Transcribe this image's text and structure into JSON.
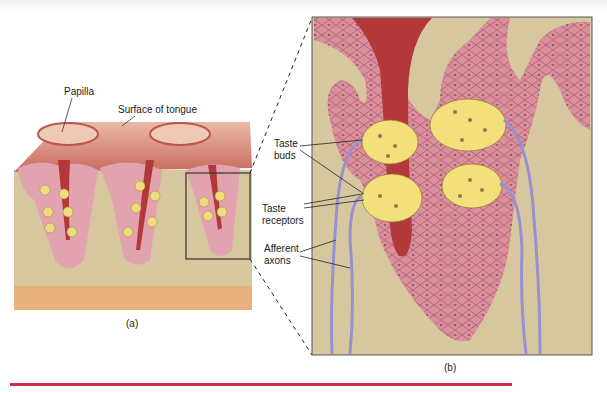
{
  "figure": {
    "panel_a": {
      "caption": "(a)",
      "labels": {
        "papilla": "Papilla",
        "surface": "Surface of tongue"
      }
    },
    "panel_b": {
      "caption": "(b)",
      "labels": {
        "taste_buds_1": "Taste",
        "taste_buds_2": "buds",
        "taste_receptors_1": "Taste",
        "taste_receptors_2": "receptors",
        "afferent_1": "Afferent",
        "afferent_2": "axons"
      }
    },
    "colors": {
      "tissue_pink": "#d98f9c",
      "papilla_surface": "#e6a99a",
      "dark_red_pore": "#b3383a",
      "background_tan": "#d6c79f",
      "taste_bud_yellow": "#f4e07a",
      "axon_purple": "#9a8fd0",
      "base_orange": "#e8b07c",
      "rule_red": "#c8304a"
    }
  }
}
